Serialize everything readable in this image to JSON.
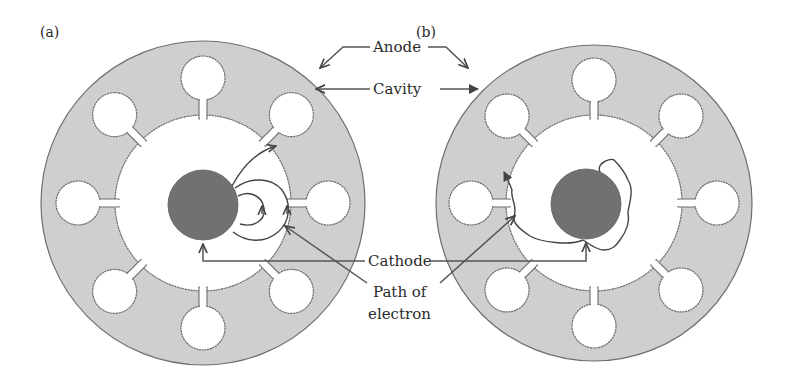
{
  "figure": {
    "panels": [
      {
        "id": "a",
        "label": "(a)",
        "center": [
          203,
          203
        ],
        "anode_outer_radius": 162,
        "anode_inner_radius": 88,
        "cavity_count": 8,
        "cavity_radius": 22,
        "cavity_center_distance": 125,
        "cathode_radius": 35,
        "cathode_center": [
          203,
          205
        ],
        "electron_path": "curved loops returning to cathode"
      },
      {
        "id": "b",
        "label": "(b)",
        "center": [
          594,
          203
        ],
        "anode_outer_radius": 158,
        "anode_inner_radius": 88,
        "cavity_count": 8,
        "cavity_radius": 22,
        "cavity_center_distance": 123,
        "cathode_radius": 35,
        "cathode_center": [
          586,
          204
        ],
        "electron_path": "irregular path reaching anode"
      }
    ],
    "labels": {
      "anode": "Anode",
      "cavity": "Cavity",
      "cathode": "Cathode",
      "path_line1": "Path of",
      "path_line2": "electron"
    },
    "colors": {
      "anode_fill": "#cfcfcf",
      "cathode_fill": "#717171",
      "outline": "#6e6e6e",
      "background": "#ffffff"
    }
  }
}
